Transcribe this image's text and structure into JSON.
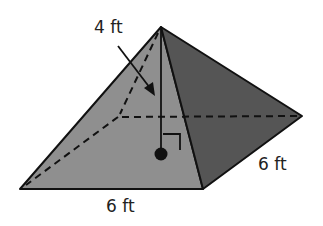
{
  "figure": {
    "type": "square pyramid",
    "colors": {
      "front_face": "#8f8f8f",
      "right_face": "#555555",
      "edge": "#111111",
      "background": "#ffffff"
    },
    "vertices": {
      "apex": [
        161,
        27
      ],
      "front_left": [
        20,
        189
      ],
      "front_right": [
        203,
        189
      ],
      "back_right": [
        302,
        116
      ],
      "back_left_hidden": [
        118,
        117
      ],
      "base_center": [
        161,
        154
      ]
    }
  },
  "labels": {
    "height": "4 ft",
    "front_edge": "6 ft",
    "side_edge": "6 ft"
  }
}
